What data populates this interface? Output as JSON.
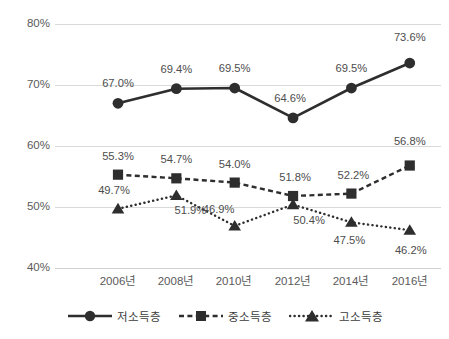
{
  "chart_data": {
    "type": "line",
    "title": "",
    "xlabel": "",
    "ylabel": "",
    "ylim": [
      40,
      80
    ],
    "yticks": [
      40,
      50,
      60,
      70,
      80
    ],
    "ytick_labels": [
      "40%",
      "50%",
      "60%",
      "70%",
      "80%"
    ],
    "grid": true,
    "legend_position": "bottom",
    "categories": [
      "2006년",
      "2008년",
      "2010년",
      "2012년",
      "2014년",
      "2016년"
    ],
    "series": [
      {
        "name": "저소득층",
        "marker": "circle",
        "linestyle": "solid",
        "color": "#2e2e2e",
        "values": [
          67.0,
          69.4,
          69.5,
          64.6,
          69.5,
          73.6
        ],
        "labels": [
          "67.0%",
          "69.4%",
          "69.5%",
          "64.6%",
          "69.5%",
          "73.6%"
        ]
      },
      {
        "name": "중소득층",
        "marker": "square",
        "linestyle": "dashed",
        "color": "#2e2e2e",
        "values": [
          55.3,
          54.7,
          54.0,
          51.8,
          52.2,
          56.8
        ],
        "labels": [
          "55.3%",
          "54.7%",
          "54.0%",
          "51.8%",
          "52.2%",
          "56.8%"
        ]
      },
      {
        "name": "고소득층",
        "marker": "triangle",
        "linestyle": "dotted",
        "color": "#2e2e2e",
        "values": [
          49.7,
          51.9,
          46.9,
          50.4,
          47.5,
          46.2
        ],
        "labels": [
          "49.7%",
          "51.9%",
          "46.9%",
          "50.4%",
          "47.5%",
          "46.2%"
        ]
      }
    ]
  },
  "axis": {
    "y_labels": [
      "80%",
      "70%",
      "60%",
      "50%",
      "40%"
    ],
    "x_labels": [
      "2006년",
      "2008년",
      "2010년",
      "2012년",
      "2014년",
      "2016년"
    ]
  },
  "legend": {
    "items": [
      {
        "label": "저소득층",
        "icon": "circle-marker-solid-line-icon"
      },
      {
        "label": "중소득층",
        "icon": "square-marker-dashed-line-icon"
      },
      {
        "label": "고소득층",
        "icon": "triangle-marker-dotted-line-icon"
      }
    ]
  },
  "data_labels": {
    "low_income": [
      "67.0%",
      "69.4%",
      "69.5%",
      "64.6%",
      "69.5%",
      "73.6%"
    ],
    "mid_income": [
      "55.3%",
      "54.7%",
      "54.0%",
      "51.8%",
      "52.2%",
      "56.8%"
    ],
    "high_income": [
      "49.7%",
      "51.9%",
      "46.9%",
      "50.4%",
      "47.5%",
      "46.2%"
    ]
  },
  "colors": {
    "series": "#2e2e2e",
    "gridline": "#d9d9d9",
    "tick_text": "#5a5a5a",
    "label_text": "#4d4d4d"
  }
}
